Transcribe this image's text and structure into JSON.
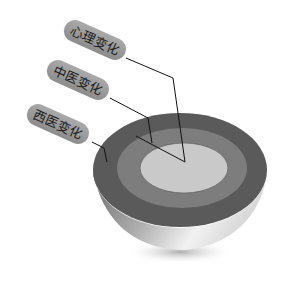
{
  "diagram": {
    "type": "layered-hemisphere",
    "layers": [
      {
        "id": "outer",
        "label": "西医变化",
        "color": "#5a5a5a"
      },
      {
        "id": "middle",
        "label": "中医变化",
        "color": "#7d7d7d"
      },
      {
        "id": "inner",
        "label": "心理变化",
        "color": "#c9c9c9"
      }
    ],
    "labels": {
      "psychological": "心理变化",
      "tcm": "中医变化",
      "western": "西医变化"
    },
    "colors": {
      "label_pill": "#9a9a9a",
      "leader_line": "#111111",
      "background": "#ffffff"
    }
  }
}
